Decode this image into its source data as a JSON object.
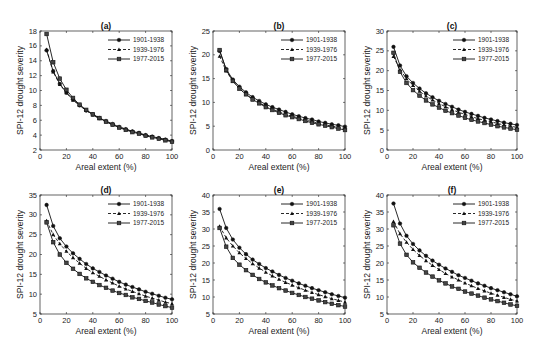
{
  "chart_data": [
    {
      "panel": "(a)",
      "type": "line",
      "title": "(a)",
      "xlabel": "Areal extent (%)",
      "ylabel": "SPI-12 drought severity",
      "xlim": [
        0,
        100
      ],
      "ylim": [
        2,
        18
      ],
      "xticks": [
        0,
        20,
        40,
        60,
        80,
        100
      ],
      "yticks": [
        2,
        4,
        6,
        8,
        10,
        12,
        14,
        16,
        18
      ],
      "grid": false,
      "legend_position": "upper right",
      "x": [
        5,
        10,
        15,
        20,
        25,
        30,
        35,
        40,
        45,
        50,
        55,
        60,
        65,
        70,
        75,
        80,
        85,
        90,
        95,
        100
      ],
      "series": [
        {
          "name": "1901-1938",
          "marker": "circle",
          "linestyle": "solid",
          "values": [
            15.4,
            12.6,
            10.9,
            9.7,
            8.8,
            8.0,
            7.3,
            6.8,
            6.3,
            5.9,
            5.5,
            5.1,
            4.8,
            4.5,
            4.3,
            4.0,
            3.8,
            3.6,
            3.4,
            3.2
          ]
        },
        {
          "name": "1939-1976",
          "marker": "triangle",
          "linestyle": "dashed",
          "values": [
            15.5,
            12.5,
            10.8,
            9.7,
            8.7,
            8.0,
            7.3,
            6.7,
            6.2,
            5.8,
            5.4,
            5.1,
            4.8,
            4.5,
            4.2,
            4.0,
            3.8,
            3.6,
            3.4,
            3.2
          ]
        },
        {
          "name": "1977-2015",
          "marker": "square",
          "linestyle": "solid",
          "values": [
            17.6,
            13.8,
            11.6,
            10.1,
            9.0,
            8.1,
            7.4,
            6.8,
            6.3,
            5.8,
            5.4,
            5.0,
            4.7,
            4.4,
            4.2,
            3.9,
            3.7,
            3.5,
            3.3,
            3.1
          ]
        }
      ]
    },
    {
      "panel": "(b)",
      "type": "line",
      "title": "(b)",
      "xlabel": "Areal extent (%)",
      "ylabel": "SPI-12 drought severity",
      "xlim": [
        0,
        100
      ],
      "ylim": [
        0,
        25
      ],
      "xticks": [
        0,
        20,
        40,
        60,
        80,
        100
      ],
      "yticks": [
        0,
        5,
        10,
        15,
        20,
        25
      ],
      "grid": false,
      "legend_position": "upper right",
      "x": [
        5,
        10,
        15,
        20,
        25,
        30,
        35,
        40,
        45,
        50,
        55,
        60,
        65,
        70,
        75,
        80,
        85,
        90,
        95,
        100
      ],
      "series": [
        {
          "name": "1901-1938",
          "marker": "circle",
          "linestyle": "solid",
          "values": [
            20.8,
            17.0,
            14.8,
            13.3,
            12.1,
            11.1,
            10.3,
            9.6,
            9.0,
            8.5,
            8.0,
            7.5,
            7.1,
            6.7,
            6.4,
            6.0,
            5.7,
            5.4,
            5.2,
            4.9
          ]
        },
        {
          "name": "1939-1976",
          "marker": "triangle",
          "linestyle": "dashed",
          "values": [
            19.7,
            16.6,
            14.5,
            12.9,
            11.7,
            10.7,
            9.9,
            9.2,
            8.6,
            8.0,
            7.5,
            7.1,
            6.7,
            6.3,
            6.0,
            5.6,
            5.3,
            5.0,
            4.8,
            4.5
          ]
        },
        {
          "name": "1977-2015",
          "marker": "square",
          "linestyle": "solid",
          "values": [
            21.0,
            16.8,
            14.5,
            12.9,
            11.7,
            10.6,
            9.8,
            9.0,
            8.4,
            7.8,
            7.3,
            6.9,
            6.5,
            6.1,
            5.7,
            5.4,
            5.1,
            4.8,
            4.5,
            4.2
          ]
        }
      ]
    },
    {
      "panel": "(c)",
      "type": "line",
      "title": "(c)",
      "xlabel": "Areal extent (%)",
      "ylabel": "SPI-12 drought severity",
      "xlim": [
        0,
        100
      ],
      "ylim": [
        0,
        30
      ],
      "xticks": [
        0,
        20,
        40,
        60,
        80,
        100
      ],
      "yticks": [
        0,
        5,
        10,
        15,
        20,
        25,
        30
      ],
      "grid": false,
      "legend_position": "upper right",
      "x": [
        5,
        10,
        15,
        20,
        25,
        30,
        35,
        40,
        45,
        50,
        55,
        60,
        65,
        70,
        75,
        80,
        85,
        90,
        95,
        100
      ],
      "series": [
        {
          "name": "1901-1938",
          "marker": "circle",
          "linestyle": "solid",
          "values": [
            26.0,
            21.3,
            18.6,
            16.9,
            15.5,
            14.3,
            13.3,
            12.4,
            11.6,
            10.9,
            10.2,
            9.6,
            9.1,
            8.6,
            8.1,
            7.7,
            7.3,
            6.9,
            6.6,
            6.3
          ]
        },
        {
          "name": "1939-1976",
          "marker": "triangle",
          "linestyle": "dashed",
          "values": [
            23.6,
            20.2,
            18.0,
            16.3,
            14.8,
            13.6,
            12.6,
            11.7,
            10.9,
            10.2,
            9.5,
            9.0,
            8.4,
            7.9,
            7.5,
            7.1,
            6.7,
            6.3,
            6.0,
            5.7
          ]
        },
        {
          "name": "1977-2015",
          "marker": "square",
          "linestyle": "solid",
          "values": [
            24.5,
            19.7,
            16.9,
            15.1,
            13.7,
            12.5,
            11.5,
            10.7,
            9.9,
            9.3,
            8.7,
            8.1,
            7.6,
            7.2,
            6.8,
            6.4,
            6.0,
            5.7,
            5.4,
            5.1
          ]
        }
      ]
    },
    {
      "panel": "(d)",
      "type": "line",
      "title": "(d)",
      "xlabel": "Areal extent (%)",
      "ylabel": "SPI-12 drought severity",
      "xlim": [
        0,
        100
      ],
      "ylim": [
        5,
        35
      ],
      "xticks": [
        0,
        20,
        40,
        60,
        80,
        100
      ],
      "yticks": [
        5,
        10,
        15,
        20,
        25,
        30,
        35
      ],
      "grid": false,
      "legend_position": "upper right",
      "x": [
        5,
        10,
        15,
        20,
        25,
        30,
        35,
        40,
        45,
        50,
        55,
        60,
        65,
        70,
        75,
        80,
        85,
        90,
        95,
        100
      ],
      "series": [
        {
          "name": "1901-1938",
          "marker": "circle",
          "linestyle": "solid",
          "values": [
            32.5,
            27.2,
            24.1,
            22.0,
            20.3,
            18.9,
            17.6,
            16.5,
            15.6,
            14.7,
            13.9,
            13.1,
            12.4,
            11.8,
            11.2,
            10.6,
            10.1,
            9.6,
            9.1,
            8.7
          ]
        },
        {
          "name": "1939-1976",
          "marker": "triangle",
          "linestyle": "dashed",
          "values": [
            28.5,
            25.0,
            22.7,
            20.8,
            19.2,
            17.8,
            16.5,
            15.4,
            14.5,
            13.6,
            12.8,
            12.0,
            11.3,
            10.7,
            10.1,
            9.5,
            9.0,
            8.5,
            8.0,
            7.6
          ]
        },
        {
          "name": "1977-2015",
          "marker": "square",
          "linestyle": "solid",
          "values": [
            28.1,
            23.1,
            20.0,
            17.9,
            16.4,
            15.1,
            14.0,
            13.1,
            12.3,
            11.6,
            10.9,
            10.3,
            9.8,
            9.2,
            8.8,
            8.3,
            7.9,
            7.4,
            7.0,
            6.6
          ]
        }
      ]
    },
    {
      "panel": "(e)",
      "type": "line",
      "title": "(e)",
      "xlabel": "Areal extent (%)",
      "ylabel": "SPI-12 drought severity",
      "xlim": [
        0,
        100
      ],
      "ylim": [
        5,
        40
      ],
      "xticks": [
        0,
        20,
        40,
        60,
        80,
        100
      ],
      "yticks": [
        5,
        10,
        15,
        20,
        25,
        30,
        35,
        40
      ],
      "grid": false,
      "legend_position": "upper right",
      "x": [
        5,
        10,
        15,
        20,
        25,
        30,
        35,
        40,
        45,
        50,
        55,
        60,
        65,
        70,
        75,
        80,
        85,
        90,
        95,
        100
      ],
      "series": [
        {
          "name": "1901-1938",
          "marker": "circle",
          "linestyle": "solid",
          "values": [
            35.9,
            30.3,
            26.9,
            24.5,
            22.6,
            21.0,
            19.7,
            18.5,
            17.5,
            16.5,
            15.6,
            14.8,
            14.0,
            13.3,
            12.6,
            12.0,
            11.4,
            10.8,
            10.3,
            9.8
          ]
        },
        {
          "name": "1939-1976",
          "marker": "triangle",
          "linestyle": "dashed",
          "values": [
            30.8,
            27.4,
            25.0,
            23.0,
            21.3,
            19.8,
            18.5,
            17.3,
            16.2,
            15.2,
            14.3,
            13.5,
            12.7,
            12.0,
            11.3,
            10.7,
            10.1,
            9.5,
            9.0,
            8.5
          ]
        },
        {
          "name": "1977-2015",
          "marker": "square",
          "linestyle": "solid",
          "values": [
            30.3,
            24.8,
            21.5,
            19.5,
            17.9,
            16.5,
            15.3,
            14.3,
            13.4,
            12.6,
            11.9,
            11.2,
            10.6,
            10.0,
            9.5,
            9.0,
            8.5,
            8.0,
            7.6,
            7.2
          ]
        }
      ]
    },
    {
      "panel": "(f)",
      "type": "line",
      "title": "(f)",
      "xlabel": "Areal extent (%)",
      "ylabel": "SPI-12 drought severity",
      "xlim": [
        0,
        100
      ],
      "ylim": [
        5,
        40
      ],
      "xticks": [
        0,
        20,
        40,
        60,
        80,
        100
      ],
      "yticks": [
        5,
        10,
        15,
        20,
        25,
        30,
        35,
        40
      ],
      "grid": false,
      "legend_position": "upper right",
      "x": [
        5,
        10,
        15,
        20,
        25,
        30,
        35,
        40,
        45,
        50,
        55,
        60,
        65,
        70,
        75,
        80,
        85,
        90,
        95,
        100
      ],
      "series": [
        {
          "name": "1901-1938",
          "marker": "circle",
          "linestyle": "solid",
          "values": [
            37.5,
            31.6,
            28.0,
            25.6,
            23.7,
            22.1,
            20.7,
            19.5,
            18.4,
            17.4,
            16.4,
            15.6,
            14.8,
            14.0,
            13.3,
            12.6,
            12.0,
            11.4,
            10.8,
            10.2
          ]
        },
        {
          "name": "1939-1976",
          "marker": "triangle",
          "linestyle": "dashed",
          "values": [
            32.2,
            28.6,
            26.1,
            24.0,
            22.2,
            20.7,
            19.3,
            18.1,
            16.9,
            15.9,
            15.0,
            14.1,
            13.3,
            12.5,
            11.8,
            11.1,
            10.5,
            9.9,
            9.3,
            8.8
          ]
        },
        {
          "name": "1977-2015",
          "marker": "square",
          "linestyle": "solid",
          "values": [
            31.1,
            25.7,
            22.4,
            20.2,
            18.6,
            17.2,
            16.0,
            14.9,
            14.0,
            13.1,
            12.4,
            11.6,
            11.0,
            10.4,
            9.8,
            9.3,
            8.8,
            8.3,
            7.8,
            7.4
          ]
        }
      ]
    }
  ],
  "panels_layout": [
    {
      "left": 40,
      "top": 31,
      "width": 132,
      "height": 119
    },
    {
      "left": 213,
      "top": 31,
      "width": 132,
      "height": 119
    },
    {
      "left": 387,
      "top": 31,
      "width": 130,
      "height": 119
    },
    {
      "left": 40,
      "top": 195,
      "width": 132,
      "height": 119
    },
    {
      "left": 213,
      "top": 195,
      "width": 132,
      "height": 119
    },
    {
      "left": 387,
      "top": 195,
      "width": 130,
      "height": 119
    }
  ],
  "colors": {
    "line": "#111111",
    "square_marker": "#444444",
    "axis": "#222222"
  }
}
